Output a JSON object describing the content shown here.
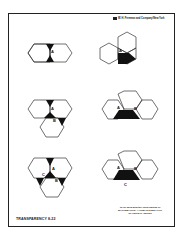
{
  "header": {
    "copyright": "W. H. Freeman and Company/New York"
  },
  "footer": {
    "transparency_label": "TRANSPARENCY 8-22",
    "note_line1": "To be used with the Third Edition of",
    "note_line2": "MATHEMATICS: A HUMAN ENDEAVOR",
    "note_line3": "by Harold R. Jacobs"
  },
  "figures": [
    {
      "id": "fig-1",
      "description": "Two hexagons sharing an edge, angles at vertex A shaded",
      "labels": [
        "A"
      ]
    },
    {
      "id": "fig-2",
      "description": "Three hexagons in a row arrangement, angle at A shaded",
      "labels": [
        "A"
      ]
    },
    {
      "id": "fig-3",
      "description": "Three hexagons with vertices A and B, angles shaded",
      "labels": [
        "A",
        "B"
      ]
    },
    {
      "id": "fig-4",
      "description": "Four hexagons, region between A and B shaded",
      "labels": [
        "A",
        "B"
      ]
    },
    {
      "id": "fig-5",
      "description": "Three hexagons around vertices A, B, C with shaded angles",
      "labels": [
        "A",
        "B",
        "C"
      ]
    },
    {
      "id": "fig-6",
      "description": "Four hexagons with shaded triangle ABC",
      "labels": [
        "A",
        "B",
        "C"
      ]
    }
  ],
  "colors": {
    "ink": "#111111",
    "line": "#333333",
    "paper": "#ffffff"
  }
}
